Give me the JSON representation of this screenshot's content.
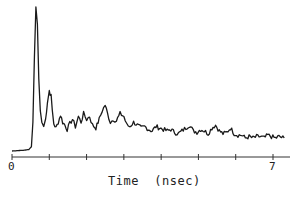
{
  "chart_data": {
    "type": "line",
    "title": "",
    "xlabel": "Time  (nsec)",
    "ylabel": "",
    "xlim": [
      0,
      7.4
    ],
    "ylim": [
      0,
      100
    ],
    "grid": false,
    "legend": null,
    "x_ticks": [
      0,
      1,
      2,
      3,
      4,
      5,
      6,
      7
    ],
    "x_tick_labels": [
      "0",
      "",
      "",
      "",
      "",
      "",
      "",
      "7"
    ],
    "series": [
      {
        "name": "intensity",
        "color": "#1a1a1a",
        "x": [
          0.0,
          0.3,
          0.45,
          0.52,
          0.56,
          0.6,
          0.64,
          0.68,
          0.72,
          0.76,
          0.8,
          0.85,
          0.9,
          0.95,
          1.0,
          1.05,
          1.08,
          1.12,
          1.18,
          1.24,
          1.3,
          1.36,
          1.42,
          1.48,
          1.55,
          1.62,
          1.7,
          1.78,
          1.85,
          1.92,
          2.0,
          2.08,
          2.16,
          2.25,
          2.34,
          2.42,
          2.5,
          2.56,
          2.64,
          2.72,
          2.8,
          2.9,
          3.0,
          3.08,
          3.16,
          3.26,
          3.36,
          3.46,
          3.56,
          3.66,
          3.76,
          3.86,
          3.96,
          4.06,
          4.16,
          4.26,
          4.36,
          4.46,
          4.56,
          4.66,
          4.76,
          4.86,
          4.96,
          5.06,
          5.16,
          5.26,
          5.36,
          5.46,
          5.56,
          5.66,
          5.76,
          5.86,
          5.96,
          6.06,
          6.16,
          6.26,
          6.36,
          6.46,
          6.56,
          6.66,
          6.76,
          6.86,
          6.96,
          7.06,
          7.16,
          7.3
        ],
        "y": [
          0,
          0.5,
          1,
          3,
          20,
          65,
          100,
          88,
          50,
          28,
          20,
          17,
          22,
          34,
          42,
          38,
          28,
          19,
          16,
          20,
          25,
          20,
          18,
          15,
          19,
          22,
          17,
          24,
          20,
          26,
          22,
          24,
          18,
          16,
          22,
          28,
          32,
          26,
          20,
          22,
          21,
          26,
          24,
          18,
          17,
          20,
          18,
          16,
          17,
          15,
          14,
          17,
          16,
          15,
          14,
          15,
          13,
          12,
          14,
          16,
          18,
          14,
          13,
          15,
          14,
          12,
          16,
          18,
          14,
          12,
          13,
          16,
          12,
          11,
          11,
          9,
          10,
          9,
          10,
          10,
          9,
          11,
          10,
          9,
          10,
          9
        ]
      }
    ],
    "annotations": []
  }
}
